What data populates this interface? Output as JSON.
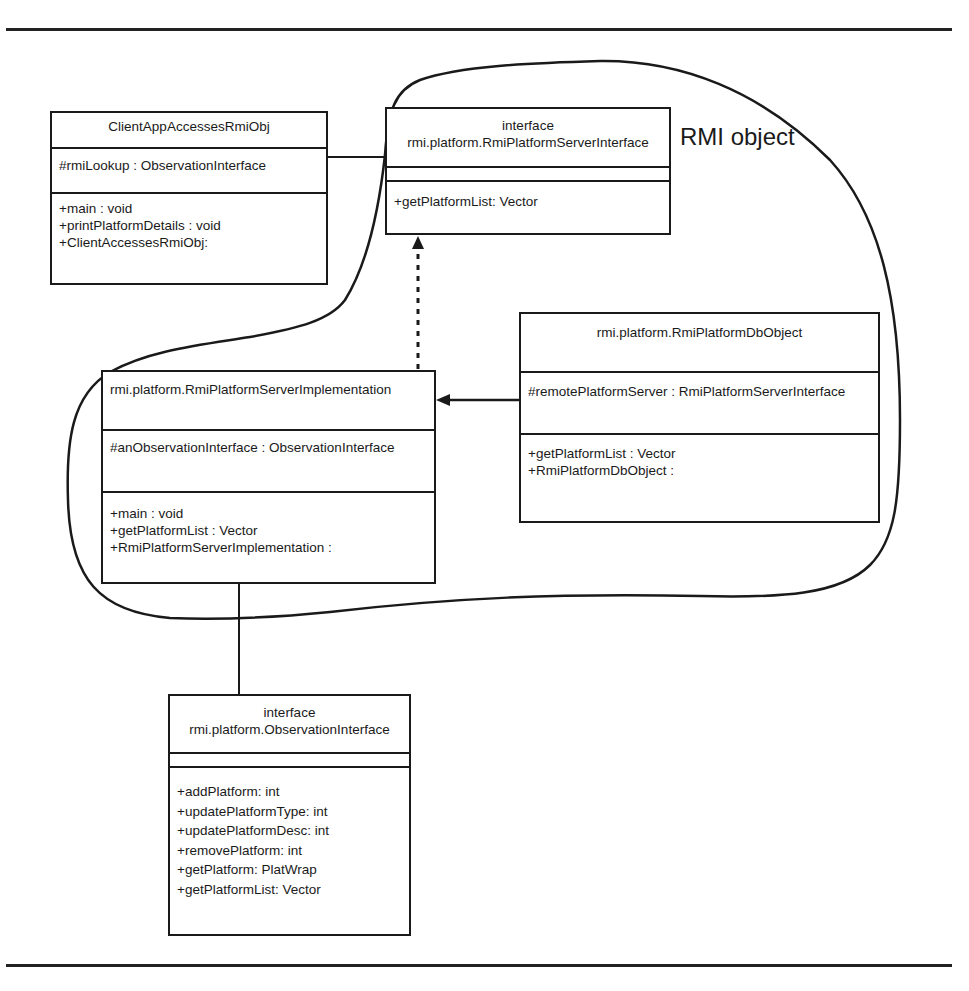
{
  "diagram": {
    "region_label": "RMI object",
    "colors": {
      "line": "#1a1a1a",
      "background": "#ffffff"
    },
    "classes": {
      "client": {
        "name": "ClientAppAccessesRmiObj",
        "attributes": [
          "#rmiLookup : ObservationInterface"
        ],
        "operations": [
          "+main : void",
          "+printPlatformDetails : void",
          "+ClientAccessesRmiObj:"
        ]
      },
      "server_interface": {
        "stereotype": "interface",
        "name": "rmi.platform.RmiPlatformServerInterface",
        "attributes": [],
        "operations": [
          "+getPlatformList: Vector"
        ]
      },
      "server_impl": {
        "name": "rmi.platform.RmiPlatformServerImplementation",
        "attributes": [
          "#anObservationInterface : ObservationInterface"
        ],
        "operations": [
          "+main : void",
          "+getPlatformList : Vector",
          "+RmiPlatformServerImplementation :"
        ]
      },
      "db_object": {
        "name": "rmi.platform.RmiPlatformDbObject",
        "attributes": [
          "#remotePlatformServer : RmiPlatformServerInterface"
        ],
        "operations": [
          "+getPlatformList : Vector",
          "+RmiPlatformDbObject :"
        ]
      },
      "observation_interface": {
        "stereotype": "interface",
        "name": "rmi.platform.ObservationInterface",
        "attributes": [],
        "operations": [
          "+addPlatform: int",
          "+updatePlatformType: int",
          "+updatePlatformDesc: int",
          "+removePlatform: int",
          "+getPlatform: PlatWrap",
          "+getPlatformList: Vector"
        ]
      }
    },
    "relationships": [
      {
        "from": "ClientAppAccessesRmiObj",
        "to": "rmi.platform.RmiPlatformServerInterface",
        "type": "association"
      },
      {
        "from": "rmi.platform.RmiPlatformServerImplementation",
        "to": "rmi.platform.RmiPlatformServerInterface",
        "type": "realization"
      },
      {
        "from": "rmi.platform.RmiPlatformDbObject",
        "to": "rmi.platform.RmiPlatformServerImplementation",
        "type": "directed-association"
      },
      {
        "from": "rmi.platform.RmiPlatformServerImplementation",
        "to": "rmi.platform.ObservationInterface",
        "type": "association"
      }
    ]
  }
}
